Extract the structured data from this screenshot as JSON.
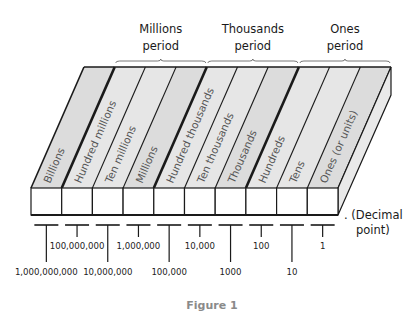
{
  "periods": [
    {
      "line1": "Millions",
      "line2": "period",
      "from_col": 1,
      "to_col": 4
    },
    {
      "line1": "Thousands",
      "line2": "period",
      "from_col": 4,
      "to_col": 7
    },
    {
      "line1": "Ones",
      "line2": "period",
      "from_col": 7,
      "to_col": 10
    }
  ],
  "columns": [
    {
      "label": "Billions",
      "value": "1,000,000,000",
      "long": true,
      "thick_right": true
    },
    {
      "label": "Hundred millions",
      "value": "100,000,000",
      "long": false,
      "thick_right": false
    },
    {
      "label": "Ten millions",
      "value": "10,000,000",
      "long": true,
      "thick_right": false
    },
    {
      "label": "Millions",
      "value": "1,000,000",
      "long": false,
      "thick_right": true
    },
    {
      "label": "Hundred thousands",
      "value": "100,000",
      "long": true,
      "thick_right": false
    },
    {
      "label": "Ten thousands",
      "value": "10,000",
      "long": false,
      "thick_right": false
    },
    {
      "label": "Thousands",
      "value": "1000",
      "long": true,
      "thick_right": true
    },
    {
      "label": "Hundreds",
      "value": "100",
      "long": false,
      "thick_right": false
    },
    {
      "label": "Tens",
      "value": "10",
      "long": true,
      "thick_right": false
    },
    {
      "label": "Ones (or units)",
      "value": "1",
      "long": false,
      "thick_right": false
    }
  ],
  "decimal_point": {
    "line1": ". (Decimal",
    "line2": "point)"
  },
  "caption": "Figure 1",
  "colors": {
    "top_face": "#e6e6e6",
    "top_face_alt": "#dcdcdc",
    "side_face": "#e9e9e9",
    "front_face": "#ffffff",
    "stroke": "#1a1a1a"
  }
}
